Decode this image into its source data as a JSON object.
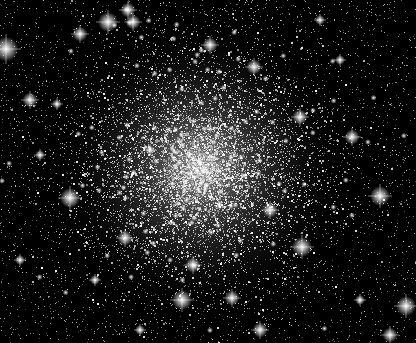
{
  "image": {
    "subject": "globular star cluster",
    "width": 416,
    "height": 343,
    "background_color": "#000000",
    "core_center": [
      200,
      168
    ],
    "core_radius": 95,
    "seed": 12345,
    "faint_star_count": 9000,
    "bright_stars": [
      [
        6,
        49,
        5
      ],
      [
        108,
        22,
        4
      ],
      [
        133,
        22,
        3
      ],
      [
        128,
        10,
        3
      ],
      [
        80,
        34,
        3
      ],
      [
        30,
        100,
        3
      ],
      [
        57,
        104,
        2
      ],
      [
        70,
        198,
        4
      ],
      [
        125,
        238,
        3
      ],
      [
        182,
        300,
        4
      ],
      [
        254,
        67,
        3
      ],
      [
        300,
        117,
        3
      ],
      [
        352,
        137,
        3
      ],
      [
        302,
        247,
        4
      ],
      [
        380,
        196,
        4
      ],
      [
        406,
        306,
        4
      ],
      [
        390,
        335,
        3
      ],
      [
        232,
        298,
        3
      ],
      [
        193,
        265,
        3
      ],
      [
        40,
        155,
        2
      ],
      [
        340,
        60,
        2
      ],
      [
        210,
        45,
        3
      ],
      [
        150,
        150,
        2
      ],
      [
        270,
        210,
        3
      ],
      [
        95,
        280,
        2
      ],
      [
        360,
        300,
        2
      ],
      [
        320,
        20,
        2
      ],
      [
        20,
        260,
        2
      ],
      [
        260,
        330,
        3
      ],
      [
        140,
        330,
        2
      ]
    ]
  }
}
